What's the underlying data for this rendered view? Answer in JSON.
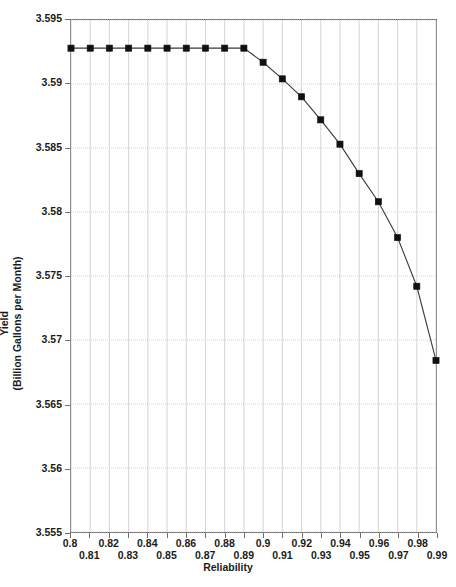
{
  "chart_data": {
    "type": "line",
    "title": "",
    "xlabel": "Reliability",
    "ylabel_line1": "Yield",
    "ylabel_line2": "(Billion Gallons per Month)",
    "xlim": [
      0.8,
      0.99
    ],
    "ylim": [
      3.555,
      3.595
    ],
    "grid": true,
    "legend": "none",
    "marker": "filled-square",
    "line_color": "#3a3a3a",
    "marker_color": "#111111",
    "grid_color": "#c9c9c9",
    "axis_color": "#6d6d6d",
    "x": [
      0.8,
      0.81,
      0.82,
      0.83,
      0.84,
      0.85,
      0.86,
      0.87,
      0.88,
      0.89,
      0.9,
      0.91,
      0.92,
      0.93,
      0.94,
      0.95,
      0.96,
      0.97,
      0.98,
      0.99
    ],
    "values": [
      3.5928,
      3.5928,
      3.5928,
      3.5928,
      3.5928,
      3.5928,
      3.5928,
      3.5928,
      3.5928,
      3.5928,
      3.5917,
      3.5904,
      3.589,
      3.5872,
      3.5853,
      3.583,
      3.5808,
      3.578,
      3.5742,
      3.5684
    ],
    "xticks": [
      0.8,
      0.81,
      0.82,
      0.83,
      0.84,
      0.85,
      0.86,
      0.87,
      0.88,
      0.89,
      0.9,
      0.91,
      0.92,
      0.93,
      0.94,
      0.95,
      0.96,
      0.97,
      0.98,
      0.99
    ],
    "xtick_labels": [
      "0.8",
      "0.81",
      "0.82",
      "0.83",
      "0.84",
      "0.85",
      "0.86",
      "0.87",
      "0.88",
      "0.89",
      "0.9",
      "0.91",
      "0.92",
      "0.93",
      "0.94",
      "0.95",
      "0.96",
      "0.97",
      "0.98",
      "0.99"
    ],
    "yticks": [
      3.555,
      3.56,
      3.565,
      3.57,
      3.575,
      3.58,
      3.585,
      3.59,
      3.595
    ],
    "ytick_labels": [
      "3.555",
      "3.56",
      "3.565",
      "3.57",
      "3.575",
      "3.58",
      "3.585",
      "3.59",
      "3.595"
    ]
  }
}
